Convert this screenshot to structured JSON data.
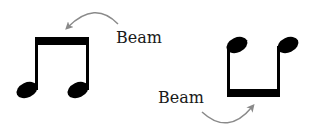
{
  "diagram": {
    "labels": {
      "top": "Beam",
      "bottom": "Beam"
    },
    "colors": {
      "notation": "#000000",
      "arrow": "#8a8a8a",
      "text": "#1a1a1a",
      "background": "#ffffff"
    },
    "groups": [
      {
        "name": "stems-up pair",
        "stem_direction": "up",
        "beam_position": "top",
        "label_ref": "top"
      },
      {
        "name": "stems-down pair",
        "stem_direction": "down",
        "beam_position": "bottom",
        "label_ref": "bottom"
      }
    ]
  }
}
